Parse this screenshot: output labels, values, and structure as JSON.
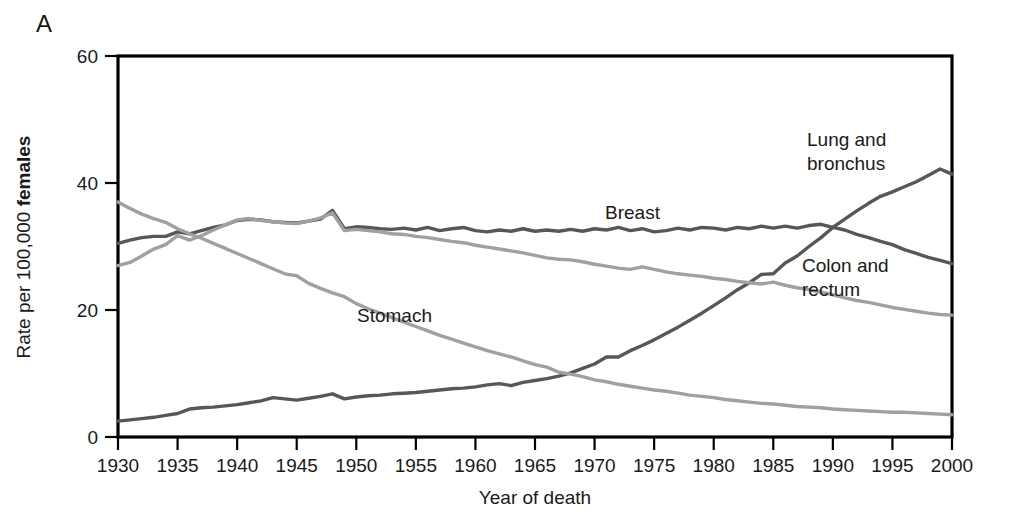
{
  "panel": {
    "label": "A"
  },
  "axes": {
    "y_title_plain": "Rate per 100,000 ",
    "y_title_bold": "females",
    "x_title": "Year of death",
    "y_ticks": [
      "0",
      "20",
      "40",
      "60"
    ],
    "x_ticks": [
      "1930",
      "1935",
      "1940",
      "1945",
      "1950",
      "1955",
      "1960",
      "1965",
      "1970",
      "1975",
      "1980",
      "1985",
      "1990",
      "1995",
      "2000"
    ]
  },
  "labels": {
    "lung_line1": "Lung and",
    "lung_line2": "bronchus",
    "breast": "Breast",
    "colon_line1": "Colon and",
    "colon_line2": "rectum",
    "stomach": "Stomach"
  },
  "chart_data": {
    "type": "line",
    "title": "",
    "xlabel": "Year of death",
    "ylabel": "Rate per 100,000 females",
    "xlim": [
      1930,
      2000
    ],
    "ylim": [
      0,
      60
    ],
    "ytick_values": [
      0,
      20,
      40,
      60
    ],
    "xtick_values": [
      1930,
      1935,
      1940,
      1945,
      1950,
      1955,
      1960,
      1965,
      1970,
      1975,
      1980,
      1985,
      1990,
      1995,
      2000
    ],
    "grid": false,
    "legend": "inline-annotations",
    "x": [
      1930,
      1931,
      1932,
      1933,
      1934,
      1935,
      1936,
      1937,
      1938,
      1939,
      1940,
      1941,
      1942,
      1943,
      1944,
      1945,
      1946,
      1947,
      1948,
      1949,
      1950,
      1951,
      1952,
      1953,
      1954,
      1955,
      1956,
      1957,
      1958,
      1959,
      1960,
      1961,
      1962,
      1963,
      1964,
      1965,
      1966,
      1967,
      1968,
      1969,
      1970,
      1971,
      1972,
      1973,
      1974,
      1975,
      1976,
      1977,
      1978,
      1979,
      1980,
      1981,
      1982,
      1983,
      1984,
      1985,
      1986,
      1987,
      1988,
      1989,
      1990,
      1991,
      1992,
      1993,
      1994,
      1995,
      1996,
      1997,
      1998,
      1999,
      2000
    ],
    "series": [
      {
        "name": "Lung and bronchus",
        "color": "#575757",
        "values": [
          2.5,
          2.7,
          2.9,
          3.1,
          3.4,
          3.7,
          4.4,
          4.6,
          4.7,
          4.9,
          5.1,
          5.4,
          5.7,
          6.2,
          6.0,
          5.8,
          6.1,
          6.4,
          6.8,
          6.0,
          6.3,
          6.5,
          6.6,
          6.8,
          6.9,
          7.0,
          7.2,
          7.4,
          7.6,
          7.7,
          7.9,
          8.2,
          8.4,
          8.1,
          8.6,
          8.9,
          9.2,
          9.6,
          10.1,
          10.8,
          11.5,
          12.6,
          12.6,
          13.6,
          14.4,
          15.3,
          16.3,
          17.3,
          18.4,
          19.5,
          20.7,
          21.9,
          23.2,
          24.3,
          25.6,
          25.7,
          27.4,
          28.5,
          30.0,
          31.4,
          33.0,
          34.3,
          35.6,
          36.8,
          37.9,
          38.6,
          39.4,
          40.2,
          41.2,
          42.2,
          41.4
        ]
      },
      {
        "name": "Breast",
        "color": "#575757",
        "values": [
          30.5,
          31.0,
          31.4,
          31.6,
          31.6,
          32.3,
          32.0,
          32.5,
          33.0,
          33.4,
          34.1,
          34.3,
          34.2,
          33.9,
          33.8,
          33.7,
          34.0,
          34.3,
          35.7,
          32.8,
          33.1,
          33.0,
          32.8,
          32.7,
          32.9,
          32.6,
          33.0,
          32.5,
          32.8,
          33.0,
          32.5,
          32.3,
          32.6,
          32.4,
          32.8,
          32.4,
          32.6,
          32.4,
          32.7,
          32.4,
          32.8,
          32.6,
          33.0,
          32.5,
          32.8,
          32.3,
          32.5,
          32.9,
          32.6,
          33.0,
          32.9,
          32.6,
          33.0,
          32.8,
          33.2,
          32.9,
          33.2,
          32.9,
          33.3,
          33.5,
          33.0,
          32.6,
          31.9,
          31.4,
          30.8,
          30.3,
          29.5,
          28.9,
          28.3,
          27.8,
          27.3
        ]
      },
      {
        "name": "Colon and rectum",
        "color": "#a0a0a0",
        "values": [
          27.0,
          27.5,
          28.5,
          29.6,
          30.3,
          31.7,
          31.0,
          31.7,
          32.6,
          33.4,
          34.2,
          34.4,
          34.1,
          33.9,
          33.7,
          33.6,
          34.0,
          34.5,
          35.3,
          32.5,
          32.7,
          32.5,
          32.3,
          32.0,
          31.9,
          31.6,
          31.4,
          31.1,
          30.8,
          30.6,
          30.2,
          29.9,
          29.6,
          29.3,
          29.0,
          28.6,
          28.2,
          28.0,
          27.9,
          27.6,
          27.2,
          26.9,
          26.6,
          26.4,
          26.8,
          26.4,
          26.0,
          25.7,
          25.5,
          25.3,
          25.0,
          24.8,
          24.5,
          24.3,
          24.1,
          24.4,
          23.9,
          23.5,
          23.2,
          22.8,
          22.4,
          21.9,
          21.5,
          21.2,
          20.8,
          20.4,
          20.1,
          19.8,
          19.5,
          19.3,
          19.2
        ]
      },
      {
        "name": "Stomach",
        "color": "#a0a0a0",
        "values": [
          37.0,
          36.0,
          35.1,
          34.4,
          33.8,
          32.8,
          32.0,
          31.3,
          30.5,
          29.7,
          28.9,
          28.1,
          27.3,
          26.5,
          25.7,
          25.4,
          24.2,
          23.4,
          22.7,
          22.1,
          21.0,
          20.2,
          19.5,
          18.8,
          18.1,
          17.4,
          16.7,
          16.0,
          15.4,
          14.8,
          14.2,
          13.6,
          13.1,
          12.6,
          12.0,
          11.4,
          11.0,
          10.2,
          9.9,
          9.5,
          9.0,
          8.7,
          8.3,
          8.0,
          7.7,
          7.4,
          7.2,
          6.9,
          6.6,
          6.4,
          6.2,
          5.9,
          5.7,
          5.5,
          5.3,
          5.2,
          5.0,
          4.8,
          4.7,
          4.6,
          4.4,
          4.3,
          4.2,
          4.1,
          4.0,
          3.9,
          3.9,
          3.8,
          3.7,
          3.6,
          3.5
        ]
      }
    ]
  }
}
